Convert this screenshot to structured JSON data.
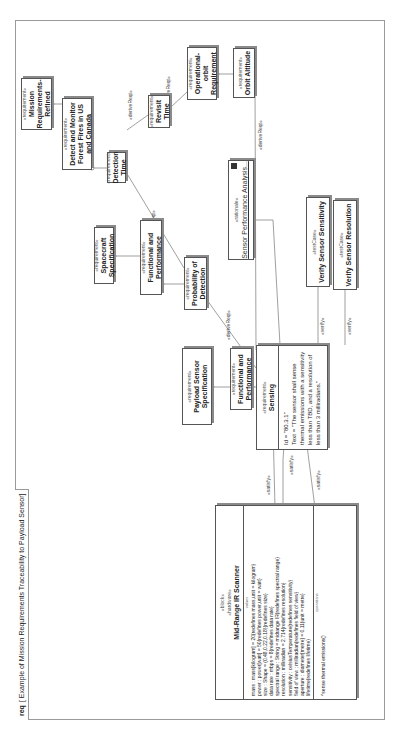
{
  "frame": {
    "kind": "req",
    "title": "[ Example of Mission Requirements Traceability to Payload Sensor]"
  },
  "stereotypes": {
    "requirement": "«requirement»",
    "testCase": "«testCase»",
    "rationale": "«rationale»",
    "block": "«block»",
    "hardware": "«hardware»"
  },
  "requirements": {
    "mission": "Mission Requirements-Refined",
    "detect": "Detect and Monitor Forest Fires in US and Canada",
    "detection_time": "Detection Time",
    "revisit_time": "Revisit Time",
    "operational_orbit": "Operational-orbit Requirement",
    "orbit_altitude": "Orbit Altitude",
    "spacecraft_spec": "Spacecraft Specification",
    "func_perf_top": "Functional and Performance",
    "probability": "Probability of Detection",
    "payload_spec": "Payload Sensor Specification",
    "func_perf_low": "Functional and Performance",
    "sensing": {
      "name": "Sensing",
      "id": "Id = \"80.3.1\"",
      "text": "Text = \"The sensor shall sense thermal emissions with a sensitivity less than TBD, and a resolution of less than 3 milliradians.\""
    }
  },
  "rationale": {
    "name": "Sensor Performance Analysis..."
  },
  "test_cases": {
    "sensitivity": "Verify Sensor Sensitivity",
    "resolution": "Verify Sensor Resolution"
  },
  "block": {
    "name": "Mid-Range IR Scanner",
    "values_label": "values",
    "attributes": [
      "mass : mass[kilogram] = 20{redefines mass,unit = kilogram}",
      "power : power[watt] = 50{redefines power,unit = watt}",
      "size : Shape = (0.48,0.22,0.18){redefines size}",
      "data rate : mbps = 8{redefines data rate}",
      "spectral range : String = midrange IR{redefines spectral range}",
      "resolution : milliradian = 2.714{redefines resolution}",
      "sensitivity : celsiusTemperature{redefines sensitivity}",
      "field of view : milliradian{redefines field of view}",
      "aperture : diameter[metre] = 0.11{unit = metre}",
      "lifetime{redefines lifetime}"
    ],
    "operations_label": "operations",
    "operations": [
      "^sense thermal emissions()"
    ]
  },
  "relations": {
    "deriveReqt": "«deriveReqt»",
    "verify": "«verify»",
    "satisfy": "«satisfy»"
  }
}
